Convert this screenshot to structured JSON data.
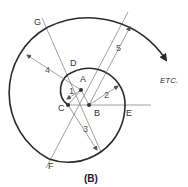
{
  "figure": {
    "caption": "(B)",
    "annotation": "ETC.",
    "points": {
      "A": "A",
      "B": "B",
      "C": "C",
      "D": "D",
      "E": "E",
      "F": "F",
      "G": "G"
    },
    "radius_labels": [
      "1",
      "2",
      "3",
      "4",
      "5"
    ],
    "colors": {
      "spiral": "#2a2a2a",
      "construction_lines": "#888888",
      "background": "#ffffff"
    }
  }
}
